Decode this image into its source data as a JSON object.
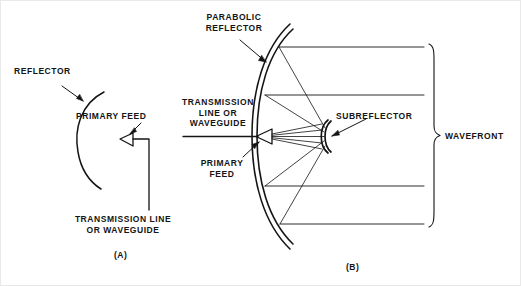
{
  "figure": {
    "title_absent": true,
    "background_color": "#ffffff",
    "ink_color": "#141414",
    "width": 521,
    "height": 286
  },
  "panel_a": {
    "caption": "(A)",
    "labels": {
      "reflector": "REFLECTOR",
      "primary_feed": "PRIMARY FEED",
      "transmission_line": "TRANSMISSION LINE\nOR WAVEGUIDE"
    },
    "parts": [
      {
        "name": "reflector-arc",
        "kind": "arc",
        "stroke": "#141414"
      },
      {
        "name": "primary-feed-horn",
        "kind": "triangle",
        "stroke": "#141414"
      },
      {
        "name": "waveguide-line",
        "kind": "polyline",
        "stroke": "#141414"
      },
      {
        "name": "reflector-leader",
        "kind": "arrow",
        "stroke": "#141414"
      },
      {
        "name": "primary-feed-leader",
        "kind": "arrow",
        "stroke": "#141414"
      }
    ]
  },
  "panel_b": {
    "caption": "(B)",
    "labels": {
      "parabolic_reflector": "PARABOLIC\nREFLECTOR",
      "transmission_line": "TRANSMISSION\nLINE OR\nWAVEGUIDE",
      "primary_feed": "PRIMARY\nFEED",
      "subreflector": "SUBREFLECTOR",
      "wavefront": "WAVEFRONT"
    },
    "parts": [
      {
        "name": "parabolic-reflector-arc",
        "kind": "double-arc",
        "stroke": "#141414"
      },
      {
        "name": "subreflector-arc",
        "kind": "double-arc",
        "stroke": "#141414"
      },
      {
        "name": "primary-feed-horn",
        "kind": "triangle",
        "stroke": "#141414"
      },
      {
        "name": "transmission-line",
        "kind": "line",
        "stroke": "#141414"
      },
      {
        "name": "feed-ray-bundle",
        "kind": "rays",
        "count": 5,
        "stroke": "#141414"
      },
      {
        "name": "spread-ray-bundle",
        "kind": "rays",
        "count": 4,
        "stroke": "#141414"
      },
      {
        "name": "wavefront-ray",
        "kind": "horizontal-lines",
        "count": 4,
        "stroke": "#141414"
      },
      {
        "name": "wavefront-brace",
        "kind": "curly-brace",
        "stroke": "#141414"
      }
    ]
  },
  "wavefront_rays": {
    "y_positions": [
      47,
      95,
      186,
      224
    ],
    "x_start": 286,
    "x_end": 424
  }
}
